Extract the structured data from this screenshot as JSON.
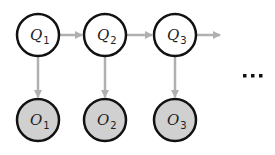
{
  "diagram": {
    "type": "hidden-markov-model",
    "colors": {
      "hidden_fill": "#ffffff",
      "observed_fill": "#d0d0d0",
      "node_stroke": "#111111",
      "edge": "#b0b0b0"
    },
    "hidden_nodes": [
      {
        "id": "Q1",
        "letter": "Q",
        "sub": "1"
      },
      {
        "id": "Q2",
        "letter": "Q",
        "sub": "2"
      },
      {
        "id": "Q3",
        "letter": "Q",
        "sub": "3"
      }
    ],
    "observed_nodes": [
      {
        "id": "O1",
        "letter": "O",
        "sub": "1"
      },
      {
        "id": "O2",
        "letter": "O",
        "sub": "2"
      },
      {
        "id": "O3",
        "letter": "O",
        "sub": "3"
      }
    ],
    "edges": [
      {
        "from": "Q1",
        "to": "Q2"
      },
      {
        "from": "Q2",
        "to": "Q3"
      },
      {
        "from": "Q3",
        "to": "continuation"
      },
      {
        "from": "Q1",
        "to": "O1"
      },
      {
        "from": "Q2",
        "to": "O2"
      },
      {
        "from": "Q3",
        "to": "O3"
      }
    ],
    "continuation": "..."
  }
}
